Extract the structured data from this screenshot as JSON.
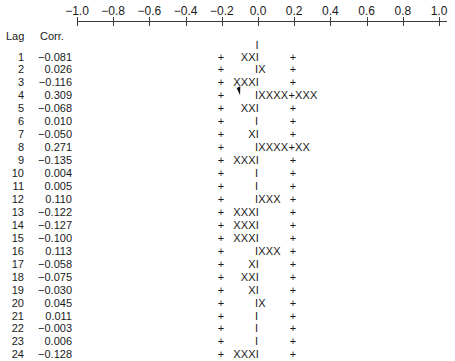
{
  "chart_data": {
    "type": "bar",
    "title": "",
    "xlabel": "Corr.",
    "ylabel": "Lag",
    "orientation": "horizontal",
    "xlim": [
      -1.0,
      1.0
    ],
    "axis_ticks": [
      "−1.0",
      "−0.8",
      "−0.6",
      "−0.4",
      "−0.2",
      "0.0",
      "0.2",
      "0.4",
      "0.6",
      "0.8",
      "1.0"
    ],
    "confidence_limits": [
      -0.2,
      0.2
    ],
    "grid": false,
    "categories": [
      1,
      2,
      3,
      4,
      5,
      6,
      7,
      8,
      9,
      10,
      11,
      12,
      13,
      14,
      15,
      16,
      17,
      18,
      19,
      20,
      21,
      22,
      23,
      24
    ],
    "values": [
      -0.081,
      0.026,
      -0.116,
      0.309,
      -0.068,
      0.01,
      -0.05,
      0.271,
      -0.135,
      0.004,
      0.005,
      0.11,
      -0.122,
      -0.127,
      -0.1,
      0.113,
      -0.058,
      -0.075,
      -0.03,
      0.045,
      0.011,
      -0.003,
      0.006,
      -0.128
    ]
  },
  "header": {
    "lag_label": "Lag",
    "corr_label": "Corr."
  },
  "top_marker": "I",
  "rows": [
    {
      "lag": "1",
      "corr": "−0.081",
      "neg": "XXI",
      "pos": ""
    },
    {
      "lag": "2",
      "corr": "0.026",
      "neg": "",
      "pos": "IX"
    },
    {
      "lag": "3",
      "corr": "−0.116",
      "neg": "XXXI",
      "pos": ""
    },
    {
      "lag": "4",
      "corr": "0.309",
      "neg": "",
      "pos": "IXXXX+XXX"
    },
    {
      "lag": "5",
      "corr": "−0.068",
      "neg": "XXI",
      "pos": ""
    },
    {
      "lag": "6",
      "corr": "0.010",
      "neg": "",
      "pos": "I"
    },
    {
      "lag": "7",
      "corr": "−0.050",
      "neg": "XI",
      "pos": ""
    },
    {
      "lag": "8",
      "corr": "0.271",
      "neg": "",
      "pos": "IXXXX+XX"
    },
    {
      "lag": "9",
      "corr": "−0.135",
      "neg": "XXXI",
      "pos": ""
    },
    {
      "lag": "10",
      "corr": "0.004",
      "neg": "",
      "pos": "I"
    },
    {
      "lag": "11",
      "corr": "0.005",
      "neg": "",
      "pos": "I"
    },
    {
      "lag": "12",
      "corr": "0.110",
      "neg": "",
      "pos": "IXXX"
    },
    {
      "lag": "13",
      "corr": "−0.122",
      "neg": "XXXI",
      "pos": ""
    },
    {
      "lag": "14",
      "corr": "−0.127",
      "neg": "XXXI",
      "pos": ""
    },
    {
      "lag": "15",
      "corr": "−0.100",
      "neg": "XXXI",
      "pos": ""
    },
    {
      "lag": "16",
      "corr": "0.113",
      "neg": "",
      "pos": "IXXX"
    },
    {
      "lag": "17",
      "corr": "−0.058",
      "neg": "XI",
      "pos": ""
    },
    {
      "lag": "18",
      "corr": "−0.075",
      "neg": "XXI",
      "pos": ""
    },
    {
      "lag": "19",
      "corr": "−0.030",
      "neg": "XI",
      "pos": ""
    },
    {
      "lag": "20",
      "corr": "0.045",
      "neg": "",
      "pos": "IX"
    },
    {
      "lag": "21",
      "corr": "0.011",
      "neg": "",
      "pos": "I"
    },
    {
      "lag": "22",
      "corr": "−0.003",
      "neg": "",
      "pos": "I"
    },
    {
      "lag": "23",
      "corr": "0.006",
      "neg": "",
      "pos": "I"
    },
    {
      "lag": "24",
      "corr": "−0.128",
      "neg": "XXXI",
      "pos": ""
    }
  ],
  "plus_marker": "+"
}
